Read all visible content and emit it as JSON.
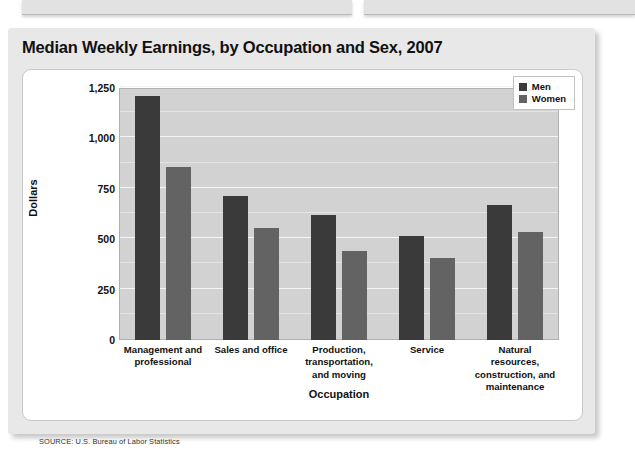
{
  "figure": {
    "title": "Median Weekly Earnings, by Occupation and Sex, 2007",
    "source": "SOURCE: U.S. Bureau of Labor Statistics"
  },
  "colors": {
    "men": "#3a3a3a",
    "women": "#636363",
    "plot_background": "#d2d2d2",
    "card_background": "#e8e8e8",
    "panel_background": "#ffffff"
  },
  "chart_data": {
    "type": "bar",
    "title": "Median Weekly Earnings, by Occupation and Sex, 2007",
    "xlabel": "Occupation",
    "ylabel": "Dollars",
    "ylim": [
      0,
      1250
    ],
    "yticks": [
      0,
      250,
      500,
      750,
      1000,
      1250
    ],
    "ytick_labels": [
      "0",
      "250",
      "500",
      "750",
      "1,000",
      "1,250"
    ],
    "minor_gridlines": [
      125,
      375,
      625,
      875,
      1125
    ],
    "grid": true,
    "legend_position": "top-right",
    "categories": [
      "Management and professional",
      "Sales and office",
      "Production, transportation, and moving",
      "Service",
      "Natural resources, construction, and maintenance"
    ],
    "category_lines": [
      [
        "Management and",
        "professional"
      ],
      [
        "Sales and office"
      ],
      [
        "Production,",
        "transportation,",
        "and moving"
      ],
      [
        "Service"
      ],
      [
        "Natural resources,",
        "construction, and",
        "maintenance"
      ]
    ],
    "series": [
      {
        "name": "Men",
        "color": "#3a3a3a",
        "values": [
          1210,
          715,
          620,
          515,
          670
        ]
      },
      {
        "name": "Women",
        "color": "#636363",
        "values": [
          860,
          555,
          440,
          405,
          535
        ]
      }
    ]
  }
}
